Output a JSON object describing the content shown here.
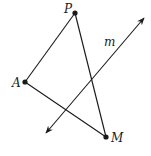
{
  "diagram": {
    "type": "geometry",
    "stroke_color": "#1a1a1a",
    "points": [
      {
        "name": "P",
        "x": 75,
        "y": 13,
        "label_x": 64,
        "label_y": 3
      },
      {
        "name": "A",
        "x": 25,
        "y": 82,
        "label_x": 12,
        "label_y": 77
      },
      {
        "name": "M",
        "x": 106,
        "y": 137,
        "label_x": 111,
        "label_y": 132
      }
    ],
    "segments": [
      {
        "from": "P",
        "to": "A"
      },
      {
        "from": "P",
        "to": "M"
      },
      {
        "from": "A",
        "to": "M"
      }
    ],
    "line": {
      "name": "m",
      "x1": 46,
      "y1": 133,
      "x2": 144,
      "y2": 18,
      "label_x": 104,
      "label_y": 36,
      "arrows": "both"
    }
  },
  "labels": {
    "P": "P",
    "A": "A",
    "M": "M",
    "m": "m"
  }
}
